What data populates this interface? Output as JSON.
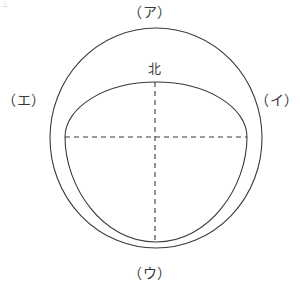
{
  "figure": {
    "type": "earth-orbit-schematic-diagram",
    "background_color": "#ffffff",
    "stroke_color": "#3a3a3a",
    "label_color": "#3a3a3a",
    "canvas": {
      "width": 300,
      "height": 287
    },
    "labels": {
      "top": "（ア）",
      "right": "（イ）",
      "bottom": "（ウ）",
      "left": "（エ）",
      "center_top": "北"
    },
    "corner_mark": "⊥",
    "shapes": {
      "outer_circle": {
        "name": "outer-circle",
        "center_x": 156,
        "center_y": 138,
        "radius_x": 106,
        "radius_y": 110,
        "style": "solid"
      },
      "inner_oval": {
        "name": "inner-egg-curve",
        "left_x": 65,
        "right_x": 247,
        "top_y": 82,
        "bottom_y": 242,
        "style": "solid"
      },
      "vertical_axis": {
        "name": "vertical-dashed-axis",
        "x": 155,
        "y_start": 82,
        "y_end": 242,
        "style": "dashed"
      },
      "horizontal_axis": {
        "name": "horizontal-dashed-axis",
        "y": 137,
        "x_start": 65,
        "x_end": 247,
        "style": "dashed"
      }
    }
  }
}
